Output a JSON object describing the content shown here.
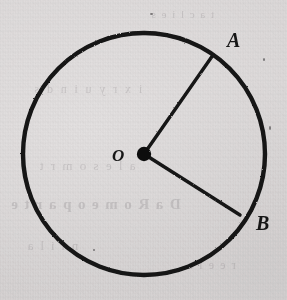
{
  "figure": {
    "canvas": {
      "width": 287,
      "height": 300
    },
    "background_color": "#eceaea",
    "ink_color": "#141414",
    "circle": {
      "name": "circle-outline",
      "center_x": 144,
      "center_y": 154,
      "radius": 121,
      "stroke_width": 4.4
    },
    "center_point": {
      "name": "center-dot",
      "x": 144,
      "y": 154,
      "radius": 7.2
    },
    "radii": [
      {
        "name": "radius-oa",
        "from_x": 144,
        "from_y": 154,
        "to_x": 213,
        "to_y": 55,
        "stroke_width": 3.4
      },
      {
        "name": "radius-ob",
        "from_x": 144,
        "from_y": 154,
        "to_x": 240,
        "to_y": 215,
        "stroke_width": 3.4
      }
    ],
    "labels": {
      "point_a": {
        "text": "A",
        "x": 227,
        "y": 47
      },
      "point_b": {
        "text": "B",
        "x": 256,
        "y": 230
      },
      "center_o": {
        "text": "O",
        "x": 112,
        "y": 161
      }
    }
  },
  "bleed_through": {
    "line_1": "i x r y u i n d s",
    "line_2": "a l e  s o m  r t",
    "line_3": "D a  R o m e  o  p a r t e",
    "line_4": "n  l  i  l  a",
    "line_5": "r e  e  i a",
    "line_6": "t a  c l i  e s"
  },
  "chart_data": {
    "type": "diagram",
    "shapes": [
      {
        "kind": "circle",
        "label": "circle",
        "cx": 144,
        "cy": 154,
        "r": 121
      },
      {
        "kind": "point",
        "label": "O",
        "x": 144,
        "y": 154
      },
      {
        "kind": "point",
        "label": "A",
        "x": 213,
        "y": 55
      },
      {
        "kind": "point",
        "label": "B",
        "x": 240,
        "y": 215
      },
      {
        "kind": "segment",
        "label": "OA",
        "x1": 144,
        "y1": 154,
        "x2": 213,
        "y2": 55
      },
      {
        "kind": "segment",
        "label": "OB",
        "x1": 144,
        "y1": 154,
        "x2": 240,
        "y2": 215
      }
    ],
    "annotations": [
      "A lies on the circle in the upper-right quadrant",
      "B lies on the circle in the lower-right quadrant",
      "O is the marked center of the circle",
      "Central angle AOB opens toward the right side of the figure"
    ]
  }
}
